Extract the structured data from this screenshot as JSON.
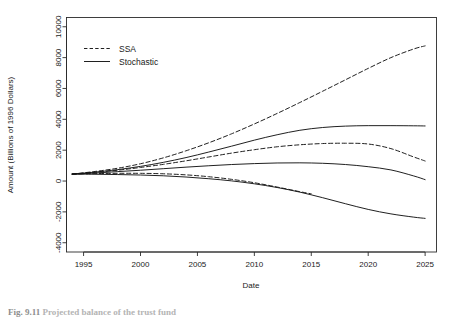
{
  "figure": {
    "caption_number": "Fig. 9.11",
    "caption_text": "Projected balance of the trust fund"
  },
  "chart_data": {
    "type": "line",
    "title": "",
    "xlabel": "Date",
    "ylabel": "Amount (Billions of 1996 Dollars)",
    "xlim": [
      1993.5,
      2026.0
    ],
    "ylim": [
      -4600,
      10600
    ],
    "xticks": [
      1995,
      2000,
      2005,
      2010,
      2015,
      2020,
      2025
    ],
    "xtick_labels": [
      "1995",
      "2000",
      "2005",
      "2010",
      "2015",
      "2020",
      "2025"
    ],
    "yticks": [
      -4000,
      -2000,
      0,
      2000,
      4000,
      6000,
      8000,
      10000
    ],
    "ytick_labels": [
      "-4000",
      "-2000",
      "0",
      "2000",
      "4000",
      "6000",
      "8000",
      "10000"
    ],
    "grid": false,
    "legend_position": "top-left",
    "legend": [
      {
        "name": "SSA",
        "style": "dashed"
      },
      {
        "name": "Stochastic",
        "style": "solid"
      }
    ],
    "series": [
      {
        "name": "SSA upper",
        "style": "dashed",
        "x": [
          1994,
          1996,
          1998,
          2000,
          2002,
          2004,
          2006,
          2008,
          2010,
          2012,
          2014,
          2016,
          2018,
          2020,
          2022,
          2024,
          2025
        ],
        "values": [
          450,
          620,
          830,
          1120,
          1500,
          1960,
          2480,
          3060,
          3700,
          4380,
          5090,
          5820,
          6560,
          7300,
          8000,
          8560,
          8760
        ]
      },
      {
        "name": "Stochastic upper",
        "style": "solid",
        "x": [
          1994,
          1996,
          1998,
          2000,
          2002,
          2004,
          2006,
          2008,
          2010,
          2012,
          2014,
          2016,
          2018,
          2020,
          2022,
          2024,
          2025
        ],
        "values": [
          450,
          580,
          740,
          950,
          1210,
          1520,
          1880,
          2260,
          2650,
          3000,
          3290,
          3470,
          3560,
          3590,
          3590,
          3580,
          3570
        ]
      },
      {
        "name": "SSA middle",
        "style": "dashed",
        "x": [
          1994,
          1996,
          1998,
          2000,
          2002,
          2004,
          2006,
          2008,
          2010,
          2012,
          2014,
          2016,
          2018,
          2020,
          2022,
          2024,
          2025
        ],
        "values": [
          450,
          560,
          700,
          880,
          1080,
          1310,
          1560,
          1810,
          2030,
          2220,
          2350,
          2430,
          2450,
          2400,
          2100,
          1560,
          1300
        ]
      },
      {
        "name": "Stochastic middle",
        "style": "solid",
        "x": [
          1994,
          1996,
          1998,
          2000,
          2002,
          2004,
          2006,
          2008,
          2010,
          2012,
          2014,
          2016,
          2018,
          2020,
          2022,
          2024,
          2025
        ],
        "values": [
          450,
          520,
          610,
          700,
          800,
          900,
          990,
          1070,
          1130,
          1170,
          1180,
          1150,
          1070,
          930,
          720,
          330,
          90
        ]
      },
      {
        "name": "SSA lower",
        "style": "dashed",
        "x": [
          1994,
          1996,
          1998,
          2000,
          2002,
          2004,
          2006,
          2008,
          2010,
          2012,
          2014,
          2015
        ],
        "values": [
          450,
          480,
          500,
          500,
          470,
          400,
          280,
          110,
          -110,
          -390,
          -690,
          -830
        ]
      },
      {
        "name": "Stochastic lower",
        "style": "solid",
        "x": [
          1994,
          1996,
          1998,
          2000,
          2002,
          2004,
          2006,
          2008,
          2010,
          2012,
          2014,
          2016,
          2018,
          2020,
          2022,
          2024,
          2025
        ],
        "values": [
          450,
          440,
          420,
          390,
          340,
          260,
          150,
          10,
          -180,
          -420,
          -720,
          -1080,
          -1470,
          -1840,
          -2130,
          -2340,
          -2420
        ]
      }
    ]
  }
}
